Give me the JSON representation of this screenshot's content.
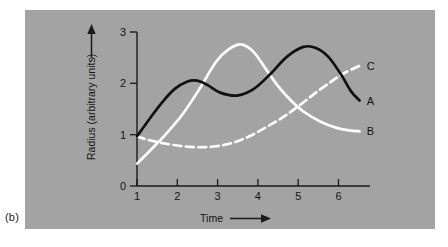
{
  "figure": {
    "subfigure_label": "(b)",
    "panel_background": "#a3a3a3"
  },
  "chart_data": {
    "type": "line",
    "title": "",
    "subtitle": "",
    "xlabel": "Time",
    "ylabel": "Radius (arbitrary units)",
    "xlabel_has_arrow": true,
    "ylabel_has_arrow": true,
    "xlim": [
      1,
      6.6
    ],
    "ylim": [
      0,
      3.1
    ],
    "x_ticks": [
      1,
      2,
      3,
      4,
      5,
      6
    ],
    "x_tick_labels": [
      "1",
      "2",
      "3",
      "4",
      "5",
      "6"
    ],
    "y_ticks": [
      0,
      1,
      2,
      3
    ],
    "y_tick_labels": [
      "0",
      "1",
      "2",
      "3"
    ],
    "grid": false,
    "legend_position": "right-of-curve-ends",
    "colors": {
      "series_a": "#111111",
      "series_b": "#ffffff",
      "series_c": "#ffffff",
      "axis": "#1a1a1a",
      "panel": "#a3a3a3"
    },
    "series": [
      {
        "name": "A",
        "label": "A",
        "color": "#111111",
        "style": "solid",
        "x": [
          1.0,
          1.3,
          1.6,
          1.9,
          2.2,
          2.45,
          2.7,
          3.0,
          3.4,
          3.8,
          4.2,
          4.6,
          5.0,
          5.3,
          5.6,
          5.9,
          6.15,
          6.35
        ],
        "y": [
          1.0,
          1.35,
          1.68,
          1.95,
          2.1,
          2.12,
          2.03,
          1.88,
          1.82,
          1.95,
          2.25,
          2.6,
          2.8,
          2.78,
          2.6,
          2.25,
          1.9,
          1.72
        ]
      },
      {
        "name": "B",
        "label": "B",
        "color": "#ffffff",
        "style": "solid",
        "x": [
          1.0,
          1.3,
          1.7,
          2.1,
          2.5,
          2.9,
          3.2,
          3.5,
          3.8,
          4.1,
          4.4,
          4.7,
          5.0,
          5.4,
          5.8,
          6.1,
          6.35
        ],
        "y": [
          0.45,
          0.7,
          1.05,
          1.45,
          1.95,
          2.5,
          2.75,
          2.85,
          2.7,
          2.35,
          2.0,
          1.72,
          1.5,
          1.3,
          1.17,
          1.12,
          1.1
        ]
      },
      {
        "name": "C",
        "label": "C",
        "color": "#ffffff",
        "style": "dashed",
        "x": [
          1.0,
          1.3,
          1.7,
          2.1,
          2.5,
          2.9,
          3.3,
          3.7,
          4.1,
          4.5,
          4.9,
          5.3,
          5.7,
          6.0,
          6.35
        ],
        "y": [
          1.0,
          0.92,
          0.85,
          0.8,
          0.78,
          0.8,
          0.87,
          1.0,
          1.18,
          1.38,
          1.62,
          1.88,
          2.12,
          2.28,
          2.42
        ]
      }
    ],
    "annotations": [
      {
        "text": "A",
        "x": 6.45,
        "y": 1.72
      },
      {
        "text": "B",
        "x": 6.45,
        "y": 1.1
      },
      {
        "text": "C",
        "x": 6.45,
        "y": 2.42
      }
    ]
  }
}
